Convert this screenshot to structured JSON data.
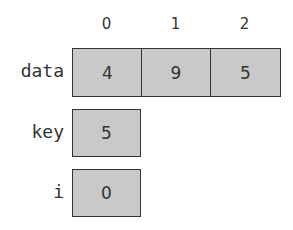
{
  "indices": [
    "0",
    "1",
    "2"
  ],
  "variables": {
    "data": {
      "label": "data",
      "values": [
        "4",
        "9",
        "5"
      ]
    },
    "key": {
      "label": "key",
      "value": "5"
    },
    "i": {
      "label": "i",
      "value": "0"
    }
  },
  "colors": {
    "cell_fill": "#c9c9c9",
    "border": "#333333"
  }
}
